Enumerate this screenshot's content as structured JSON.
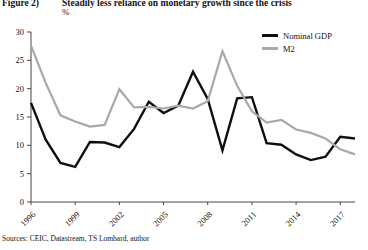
{
  "figure": {
    "label": "Figure 2)",
    "title": "Steadily less reliance on monetary growth since the crisis",
    "unit": "%"
  },
  "source": {
    "note": "Sources: CEIC, Datastream, TS Lombard, author"
  },
  "legend": {
    "position": "top-right",
    "items": [
      {
        "name": "Nominal GDP",
        "color": "#100f0d"
      },
      {
        "name": "M2",
        "color": "#a9a9a9"
      }
    ]
  },
  "chart_data": {
    "type": "line",
    "title": "Steadily less reliance on monetary growth since the crisis",
    "xlabel": "",
    "ylabel": "%",
    "ylim": [
      0,
      30
    ],
    "yticks": [
      0,
      5,
      10,
      15,
      20,
      25,
      30
    ],
    "xticks": [
      "1996",
      "1999",
      "2002",
      "2005",
      "2008",
      "2011",
      "2014",
      "2017"
    ],
    "grid": false,
    "x": [
      1996,
      1997,
      1998,
      1999,
      2000,
      2001,
      2002,
      2003,
      2004,
      2005,
      2006,
      2007,
      2008,
      2009,
      2010,
      2011,
      2012,
      2013,
      2014,
      2015,
      2016,
      2017,
      2018
    ],
    "series": [
      {
        "name": "Nominal GDP",
        "color": "#100f0d",
        "values": [
          17.5,
          11.0,
          6.9,
          6.2,
          10.6,
          10.5,
          9.7,
          12.9,
          17.7,
          15.7,
          17.0,
          23.0,
          18.2,
          9.1,
          18.3,
          18.5,
          10.4,
          10.1,
          8.4,
          7.4,
          8.0,
          11.5,
          11.2
        ]
      },
      {
        "name": "M2",
        "color": "#a9a9a9",
        "values": [
          27.6,
          21.0,
          15.3,
          14.2,
          13.3,
          13.6,
          19.9,
          16.7,
          16.8,
          16.5,
          17.0,
          16.5,
          17.8,
          26.6,
          20.5,
          16.0,
          14.0,
          14.5,
          12.8,
          12.2,
          11.2,
          9.3,
          8.4
        ]
      }
    ]
  }
}
